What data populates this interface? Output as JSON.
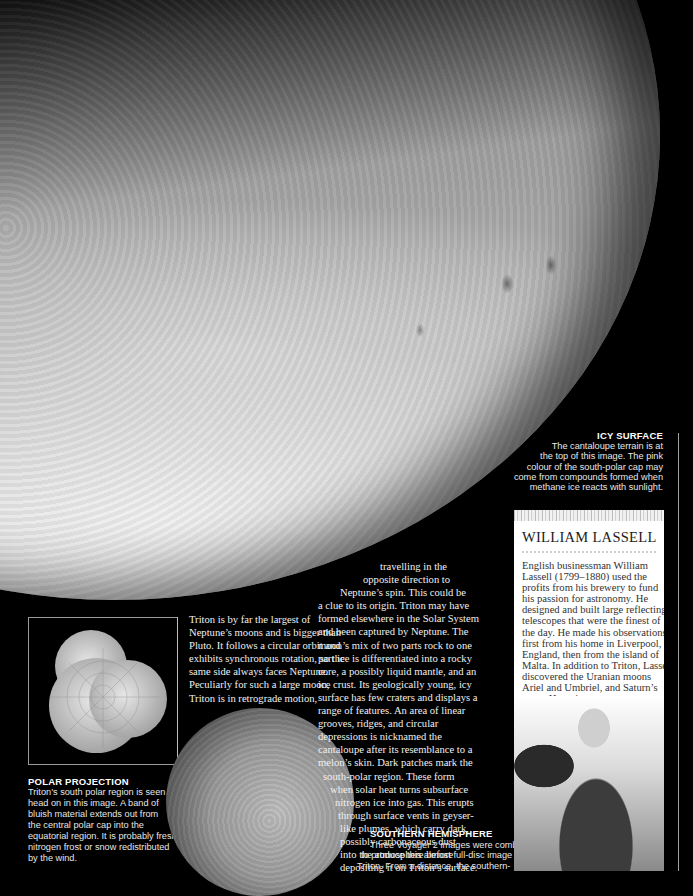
{
  "images": {
    "main": "icy-surface-photo",
    "polar": "polar-projection-photo",
    "southern": "southern-hemisphere-photo",
    "portrait": "william-lassell-portrait"
  },
  "main_text": {
    "left_lines": [
      "Triton is by far the largest of",
      "Neptune’s moons and is bigger than",
      "Pluto. It follows a circular orbit and",
      "exhibits synchronous rotation, so the",
      "same side always faces Neptune.",
      "Peculiarly for such a large moon,",
      "Triton is in retrograde motion,"
    ],
    "right_lines": [
      "travelling in the",
      "opposite direction to",
      "Neptune’s spin. This could be",
      "a clue to its origin. Triton may have",
      "formed elsewhere in the Solar System",
      "and been captured by Neptune. The",
      "moon’s mix of two parts rock to one",
      "part ice is differentiated into a rocky",
      "core, a possibly liquid mantle, and an",
      "ice crust. Its geologically young, icy",
      "surface has few craters and displays a",
      "range of features. An area of linear",
      "grooves, ridges, and circular",
      "depressions is nicknamed the",
      "cantaloupe after its resemblance to a",
      "melon’s skin. Dark patches mark the",
      "south-polar region. These form",
      "when solar heat turns subsurface",
      "nitrogen ice into gas. This erupts",
      "through surface vents in geyser-",
      "like plumes, which carry dark,",
      "possibly carbonaceous dust",
      "into the atmosphere before",
      "depositing it on Triton’s surface."
    ]
  },
  "captions": {
    "icy_surface": {
      "title": "ICY SURFACE",
      "lines": [
        "The cantaloupe terrain is at",
        "the top of this image. The pink",
        "colour of the south-polar cap may",
        "come from compounds formed when",
        "methane ice reacts with sunlight."
      ]
    },
    "polar_projection": {
      "title": "POLAR PROJECTION",
      "lines": [
        "Triton’s south polar region is seen",
        "head on in this image. A band of",
        "bluish material extends out from",
        "the central polar cap into the",
        "equatorial region. It is probably fresh",
        "nitrogen frost or snow redistributed",
        "by the wind."
      ]
    },
    "southern_hemisphere": {
      "title": "SOUTHERN HEMISPHERE",
      "lines": [
        "Three Voyager 2 images were combined",
        "to produce this almost full-disc image of",
        "Triton. From a distance, the southern-"
      ]
    }
  },
  "lassell": {
    "title": "WILLIAM LASSELL",
    "lines": [
      "English businessman William",
      "Lassell (1799–1880) used the",
      "profits from his brewery to fund",
      "his passion for astronomy. He",
      "designed and built large reflecting",
      "telescopes that were the finest of",
      "the day. He made his observations",
      "first from his home in Liverpool,",
      "England, then from the island of",
      "Malta. In addition to Triton, Lassell",
      "discovered the Uranian moons",
      "Ariel and Umbriel, and Saturn’s",
      "moon Hyperion."
    ]
  }
}
